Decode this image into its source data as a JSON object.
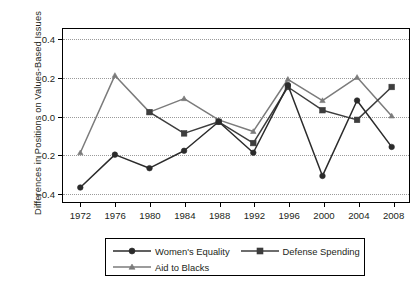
{
  "chart_data": {
    "type": "line",
    "title": "",
    "xlabel": "",
    "ylabel": "Differences in Positions on Values-Based Issues",
    "x": [
      1972,
      1976,
      1980,
      1984,
      1988,
      1992,
      1996,
      2000,
      2004,
      2008
    ],
    "xticklabels": [
      "1972",
      "1976",
      "1980",
      "1984",
      "1988",
      "1992",
      "1996",
      "2000",
      "2004",
      "2008"
    ],
    "yticklabels": [
      "0.4",
      "0.2",
      "0.0",
      "-0.2",
      "-0.4"
    ],
    "ytickvalues": [
      0.4,
      0.2,
      0.0,
      -0.2,
      -0.4
    ],
    "xlim": [
      1970,
      2010
    ],
    "ylim": [
      -0.45,
      0.45
    ],
    "grid": "horizontal-dotted",
    "legend_position": "below-axes",
    "series": [
      {
        "name": "Women's Equality",
        "marker": "circle",
        "color": "#2b2b2b",
        "values": [
          -0.37,
          -0.2,
          -0.27,
          -0.18,
          -0.03,
          -0.19,
          0.16,
          -0.31,
          0.08,
          -0.16
        ]
      },
      {
        "name": "Defense Spending",
        "marker": "square",
        "color": "#3d3d3d",
        "values": [
          null,
          null,
          0.02,
          -0.09,
          -0.03,
          -0.14,
          0.15,
          0.03,
          -0.02,
          0.15
        ]
      },
      {
        "name": "Aid to Blacks",
        "marker": "triangle",
        "color": "#7b7b7b",
        "values": [
          -0.19,
          0.21,
          0.02,
          0.09,
          -0.02,
          -0.08,
          0.19,
          0.08,
          0.2,
          0.0
        ]
      }
    ]
  },
  "legend": {
    "items": [
      {
        "label": "Women's Equality",
        "marker": "circle",
        "color": "#2b2b2b"
      },
      {
        "label": "Defense Spending",
        "marker": "square",
        "color": "#3d3d3d"
      },
      {
        "label": "Aid to Blacks",
        "marker": "triangle",
        "color": "#7b7b7b"
      }
    ]
  }
}
